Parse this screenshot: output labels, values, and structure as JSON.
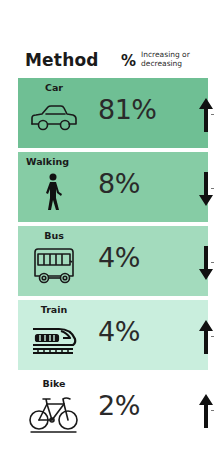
{
  "header": {
    "method_label": "Method",
    "percent_label": "%",
    "trend_label_line1": "Increasing or",
    "trend_label_line2": "decreasing"
  },
  "rows": [
    {
      "label": "Car",
      "icon": "car-icon",
      "value": "81%",
      "trend": "increasing",
      "color": "#6fbf94"
    },
    {
      "label": "Walking",
      "icon": "walking-person-icon",
      "value": "8%",
      "trend": "decreasing",
      "color": "#86cca5"
    },
    {
      "label": "Bus",
      "icon": "bus-icon",
      "value": "4%",
      "trend": "decreasing",
      "color": "#a3dbbd"
    },
    {
      "label": "Train",
      "icon": "train-icon",
      "value": "4%",
      "trend": "increasing",
      "color": "#c9eedd"
    },
    {
      "label": "Bike",
      "icon": "bicycle-icon",
      "value": "2%",
      "trend": "increasing",
      "color": "#ffffff"
    }
  ]
}
